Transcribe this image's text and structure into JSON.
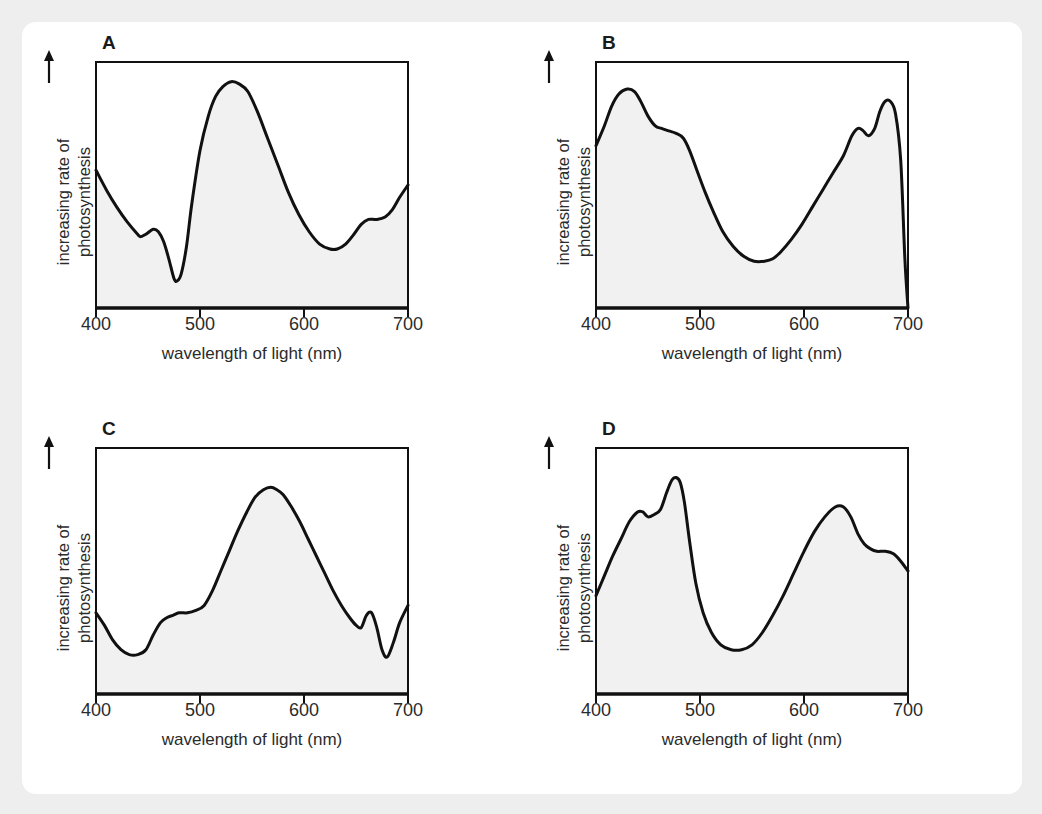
{
  "figure": {
    "background_color": "#eeeeee",
    "card_color": "#ffffff",
    "curve_color": "#111111",
    "fill_color": "#f1f1f1"
  },
  "common": {
    "x_axis_title": "wavelength of light (nm)",
    "y_axis_line1": "increasing rate of",
    "y_axis_line2": "photosynthesis",
    "y_arrow_icon": "up-arrow-icon",
    "x_tick_labels": [
      "400",
      "500",
      "600",
      "700"
    ],
    "x_tick_values": [
      400,
      500,
      600,
      700
    ]
  },
  "chart_data": [
    {
      "type": "line",
      "panel": "A",
      "title": "A",
      "xlabel": "wavelength of light (nm)",
      "ylabel": "increasing rate of photosynthesis",
      "xlim": [
        400,
        700
      ],
      "ylim": [
        0,
        100
      ],
      "grid": false,
      "legend": "none",
      "filled": true,
      "x": [
        400,
        410,
        420,
        430,
        440,
        443,
        448,
        455,
        460,
        465,
        470,
        475,
        478,
        482,
        487,
        492,
        500,
        508,
        515,
        522,
        530,
        538,
        546,
        555,
        565,
        575,
        585,
        595,
        605,
        615,
        625,
        632,
        640,
        648,
        655,
        662,
        670,
        678,
        685,
        692,
        700
      ],
      "y": [
        56,
        48,
        41,
        35,
        30,
        29,
        30,
        32,
        31,
        27,
        20,
        12,
        11,
        14,
        25,
        42,
        64,
        78,
        86,
        90,
        92,
        91,
        88,
        80,
        69,
        58,
        47,
        38,
        31,
        26,
        24,
        24,
        26,
        30,
        34,
        36,
        36,
        37,
        40,
        45,
        50
      ]
    },
    {
      "type": "line",
      "panel": "B",
      "title": "B",
      "xlabel": "wavelength of light (nm)",
      "ylabel": "increasing rate of photosynthesis",
      "xlim": [
        400,
        700
      ],
      "ylim": [
        0,
        100
      ],
      "grid": false,
      "legend": "none",
      "filled": true,
      "x": [
        400,
        408,
        415,
        422,
        430,
        437,
        443,
        450,
        457,
        463,
        470,
        477,
        484,
        490,
        497,
        505,
        513,
        522,
        532,
        542,
        552,
        562,
        570,
        578,
        588,
        598,
        608,
        618,
        628,
        638,
        646,
        652,
        657,
        662,
        668,
        673,
        678,
        683,
        688,
        693,
        697,
        700
      ],
      "y": [
        66,
        74,
        82,
        87,
        89,
        88,
        84,
        78,
        74,
        73,
        72,
        71,
        69,
        64,
        56,
        47,
        39,
        31,
        25,
        21,
        19,
        19,
        20,
        23,
        28,
        34,
        41,
        48,
        55,
        62,
        70,
        73,
        72,
        70,
        73,
        80,
        84,
        84,
        79,
        60,
        20,
        0
      ]
    },
    {
      "type": "line",
      "panel": "C",
      "title": "C",
      "xlabel": "wavelength of light (nm)",
      "ylabel": "increasing rate of photosynthesis",
      "xlim": [
        400,
        700
      ],
      "ylim": [
        0,
        100
      ],
      "grid": false,
      "legend": "none",
      "filled": true,
      "x": [
        400,
        408,
        416,
        424,
        432,
        440,
        448,
        455,
        462,
        468,
        474,
        480,
        488,
        496,
        504,
        512,
        520,
        528,
        536,
        545,
        553,
        561,
        568,
        574,
        580,
        588,
        596,
        604,
        612,
        620,
        628,
        636,
        644,
        650,
        655,
        660,
        665,
        670,
        675,
        680,
        686,
        692,
        700
      ],
      "y": [
        33,
        28,
        22,
        18,
        16,
        16,
        18,
        24,
        29,
        31,
        32,
        33,
        33,
        34,
        36,
        42,
        50,
        58,
        66,
        74,
        80,
        83,
        84,
        83,
        81,
        76,
        70,
        63,
        56,
        49,
        42,
        36,
        31,
        28,
        27,
        32,
        33,
        27,
        18,
        15,
        21,
        29,
        36
      ]
    },
    {
      "type": "line",
      "panel": "D",
      "title": "D",
      "xlabel": "wavelength of light (nm)",
      "ylabel": "increasing rate of photosynthesis",
      "xlim": [
        400,
        700
      ],
      "ylim": [
        0,
        100
      ],
      "grid": false,
      "legend": "none",
      "filled": true,
      "x": [
        400,
        408,
        416,
        424,
        432,
        440,
        445,
        450,
        456,
        462,
        468,
        473,
        477,
        481,
        485,
        490,
        496,
        503,
        511,
        520,
        530,
        540,
        550,
        560,
        570,
        580,
        590,
        600,
        610,
        620,
        630,
        638,
        645,
        652,
        658,
        664,
        670,
        678,
        686,
        693,
        700
      ],
      "y": [
        40,
        48,
        56,
        63,
        70,
        74,
        74,
        72,
        73,
        75,
        82,
        87,
        88,
        86,
        78,
        62,
        45,
        33,
        25,
        20,
        18,
        18,
        20,
        25,
        32,
        40,
        49,
        58,
        66,
        72,
        76,
        76,
        72,
        65,
        61,
        59,
        58,
        58,
        57,
        54,
        50
      ]
    }
  ]
}
